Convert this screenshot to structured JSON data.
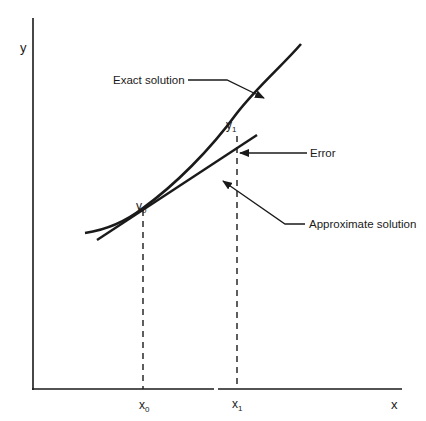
{
  "figure": {
    "axes": {
      "x_label": "x",
      "y_label": "y"
    },
    "points": {
      "x0": {
        "label": "x",
        "sub": "0"
      },
      "x1": {
        "label": "x",
        "sub": "1"
      },
      "y0": {
        "label": "y",
        "sub": "0"
      },
      "y1": {
        "label": "y",
        "sub": "1"
      }
    },
    "annotations": {
      "exact": "Exact solution",
      "error": "Error",
      "approx": "Approximate solution"
    },
    "colors": {
      "ink": "#1a1a1a",
      "background": "#ffffff"
    }
  }
}
